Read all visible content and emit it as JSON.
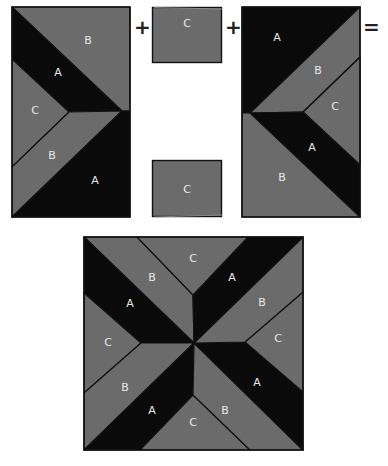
{
  "colors": {
    "A": "#0a0a0a",
    "B": "#6b6b6b",
    "C": "#6b6b6b",
    "seam": "#111111",
    "label": "#e8e8e8",
    "background": "#ffffff"
  },
  "operators": {
    "plus_1": "+",
    "plus_2": "+",
    "equals": "="
  },
  "left_unit": {
    "pieces": [
      {
        "id": "B",
        "label": "B"
      },
      {
        "id": "A",
        "label": "A"
      },
      {
        "id": "C",
        "label": "C"
      },
      {
        "id": "B",
        "label": "B"
      },
      {
        "id": "A",
        "label": "A"
      }
    ]
  },
  "center_squares": {
    "top": {
      "label": "C"
    },
    "bottom": {
      "label": "C"
    }
  },
  "right_unit": {
    "pieces": [
      {
        "id": "A",
        "label": "A"
      },
      {
        "id": "B",
        "label": "B"
      },
      {
        "id": "C",
        "label": "C"
      },
      {
        "id": "A",
        "label": "A"
      },
      {
        "id": "B",
        "label": "B"
      }
    ]
  },
  "finished_block": {
    "pieces": [
      {
        "id": "C",
        "label": "C",
        "position": "top"
      },
      {
        "id": "B",
        "label": "B",
        "position": "upper-left"
      },
      {
        "id": "A",
        "label": "A",
        "position": "upper-left"
      },
      {
        "id": "A",
        "label": "A",
        "position": "upper-right"
      },
      {
        "id": "B",
        "label": "B",
        "position": "upper-right"
      },
      {
        "id": "C",
        "label": "C",
        "position": "left"
      },
      {
        "id": "C",
        "label": "C",
        "position": "right"
      },
      {
        "id": "B",
        "label": "B",
        "position": "lower-left"
      },
      {
        "id": "A",
        "label": "A",
        "position": "lower-right"
      },
      {
        "id": "A",
        "label": "A",
        "position": "lower-left"
      },
      {
        "id": "C",
        "label": "C",
        "position": "bottom"
      },
      {
        "id": "B",
        "label": "B",
        "position": "lower-right"
      }
    ]
  }
}
